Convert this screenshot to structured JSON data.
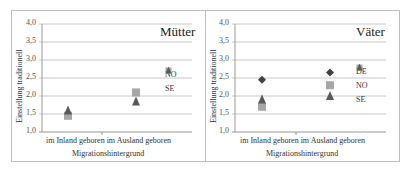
{
  "chart_data": [
    {
      "type": "scatter",
      "title": "Mütter",
      "xlabel": "Migrationshintergrund",
      "ylabel": "Einstellung traditionell",
      "categories": [
        "im Inland geboren",
        "im Ausland geboren"
      ],
      "ylim": [
        1.0,
        4.0
      ],
      "yticks": [
        "1,0",
        "1,5",
        "2,0",
        "2,5",
        "3,0",
        "3,5",
        "4,0"
      ],
      "grid": true,
      "legend_position": "right",
      "series": [
        {
          "name": "NO",
          "marker": "square",
          "color": "#a6a6a6",
          "values": [
            1.45,
            2.1
          ]
        },
        {
          "name": "SE",
          "marker": "triangle",
          "color": "#595959",
          "values": [
            1.6,
            1.85
          ]
        }
      ]
    },
    {
      "type": "scatter",
      "title": "Väter",
      "xlabel": "Migrationshintergrund",
      "ylabel": "Einstellung traditionell",
      "categories": [
        "im Inland geboren",
        "im Ausland geboren"
      ],
      "ylim": [
        1.0,
        4.0
      ],
      "yticks": [
        "1,0",
        "1,5",
        "2,0",
        "2,5",
        "3,0",
        "3,5",
        "4,0"
      ],
      "grid": true,
      "legend_position": "right",
      "series": [
        {
          "name": "DE",
          "marker": "diamond",
          "color": "#404040",
          "values": [
            2.45,
            2.65
          ]
        },
        {
          "name": "NO",
          "marker": "square",
          "color": "#a6a6a6",
          "values": [
            1.7,
            2.3
          ]
        },
        {
          "name": "SE",
          "marker": "triangle",
          "color": "#595959",
          "values": [
            1.9,
            2.0
          ]
        }
      ]
    }
  ]
}
